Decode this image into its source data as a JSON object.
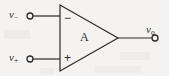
{
  "figure": {
    "background_color": "#f4f3f1",
    "line_color": "#2b2b2b"
  },
  "labels": {
    "inverting_input": "v",
    "inverting_input_sub": "−",
    "noninverting_input": "v",
    "noninverting_input_sub": "+",
    "output": "v",
    "output_sub": "o",
    "gain": "A",
    "inverting_sign": "−",
    "noninverting_sign": "+"
  },
  "geometry": {
    "triangle_points": "60,5 60,71 118,38",
    "input_minus_wire": "33,16 60,16",
    "input_plus_wire": "33,59 60,59",
    "output_wire": "118,38 152,38",
    "terminal_minus": {
      "cx": 30,
      "cy": 16,
      "r": 3
    },
    "terminal_plus": {
      "cx": 30,
      "cy": 59,
      "r": 3
    },
    "terminal_out": {
      "cx": 155,
      "cy": 38,
      "r": 3
    }
  }
}
